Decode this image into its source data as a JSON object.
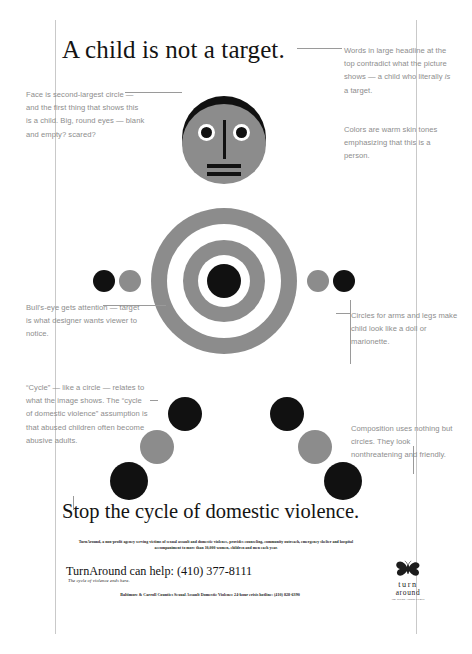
{
  "poster": {
    "headline_top": "A child is not a target.",
    "headline_bottom": "Stop the cycle of domestic violence."
  },
  "annotations": {
    "face": "Face is second-largest circle — and the first thing that shows this is a child. Big, round eyes — blank and empty? scared?",
    "headline_part1": "Words in large headline at the top contradict what the picture shows — a child who literally ",
    "headline_italic": "is",
    "headline_part2": " a target.",
    "colors": "Colors are warm skin tones emphasizing that this is a person.",
    "bullseye": "Bull's-eye gets attention — target is what designer wants viewer to notice.",
    "cycle": "“Cycle” — like a circle — relates to what the image shows. The “cycle of domestic violence” assumption is that abused children often become abusive adults.",
    "arms": "Circles for arms and legs make child look like a doll or marionette.",
    "composition": "Composition uses nothing but circles. They look nonthreatening and friendly."
  },
  "fineprint": {
    "body_copy": "TurnAround, a non-profit agency serving victims of sexual assault and domestic violence, provides counseling, community outreach, emergency shelter and hospital accompaniment to more than 10,000 women, children and men each year.",
    "help_line": "TurnAround can help: (410) 377-8111",
    "tagline": "The cycle of violence ends here.",
    "hotline": "Baltimore & Carroll Counties Sexual Assault Domestic Violence 24-hour crisis hotline: (410) 828-6390"
  },
  "logo": {
    "word_turn": "turn",
    "word_around": "around",
    "sub": "The Sexual Assault Center"
  },
  "colors": {
    "skin_gray": "#8c8c8c",
    "black": "#111111",
    "white": "#ffffff",
    "note_gray": "#8d8d8d",
    "rule_gray": "#9a9a9a",
    "sheet_border": "#c9c9c9"
  },
  "figure": {
    "head": {
      "cx": 224,
      "cy": 140,
      "r": 42
    },
    "bullseye": {
      "cx": 224,
      "cy": 281,
      "rings": [
        73,
        57,
        41,
        26,
        17
      ]
    },
    "arm_circles_left": [
      {
        "cx": 104,
        "cy": 281,
        "r": 11,
        "fill": "black"
      },
      {
        "cx": 130,
        "cy": 281,
        "r": 11,
        "fill": "gray"
      }
    ],
    "arm_circles_right": [
      {
        "cx": 344,
        "cy": 281,
        "r": 11,
        "fill": "black"
      },
      {
        "cx": 318,
        "cy": 281,
        "r": 11,
        "fill": "gray"
      }
    ],
    "leg_circles": [
      {
        "cx": 185,
        "cy": 414,
        "r": 17,
        "fill": "black"
      },
      {
        "cx": 157,
        "cy": 447,
        "r": 17,
        "fill": "gray"
      },
      {
        "cx": 129,
        "cy": 481,
        "r": 19,
        "fill": "black"
      },
      {
        "cx": 287,
        "cy": 414,
        "r": 17,
        "fill": "black"
      },
      {
        "cx": 315,
        "cy": 447,
        "r": 17,
        "fill": "gray"
      },
      {
        "cx": 343,
        "cy": 481,
        "r": 19,
        "fill": "black"
      }
    ]
  }
}
